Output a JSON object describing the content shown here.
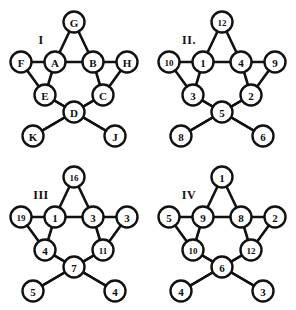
{
  "figure": {
    "background_color": "#ffffff",
    "ink_color": "#111111",
    "panel_count": 4
  },
  "chart_data": {
    "type": "diagram",
    "subtype": "pentagram-node-graph",
    "layout": "2x2 grid of panels",
    "node_positions": {
      "apex": [
        74,
        22
      ],
      "upper_left": [
        21,
        62
      ],
      "upper_right": [
        127,
        62
      ],
      "inner_left": [
        55,
        62
      ],
      "inner_right": [
        93,
        62
      ],
      "mid_left": [
        45,
        95
      ],
      "mid_right": [
        103,
        95
      ],
      "bottom_center": [
        74,
        112
      ],
      "bottom_left": [
        33,
        136
      ],
      "bottom_right": [
        115,
        136
      ]
    },
    "edges": [
      [
        "apex",
        "inner_left"
      ],
      [
        "apex",
        "inner_right"
      ],
      [
        "inner_left",
        "inner_right"
      ],
      [
        "upper_left",
        "inner_left"
      ],
      [
        "inner_right",
        "upper_right"
      ],
      [
        "upper_left",
        "mid_left"
      ],
      [
        "upper_right",
        "mid_right"
      ],
      [
        "inner_left",
        "mid_left"
      ],
      [
        "inner_right",
        "mid_right"
      ],
      [
        "mid_left",
        "bottom_center"
      ],
      [
        "mid_right",
        "bottom_center"
      ],
      [
        "mid_left",
        "bottom_right"
      ],
      [
        "mid_right",
        "bottom_left"
      ],
      [
        "bottom_left",
        "bottom_center"
      ],
      [
        "bottom_right",
        "bottom_center"
      ]
    ],
    "panels": [
      {
        "roman": "I",
        "label_style": "letters",
        "nodes": {
          "apex": "G",
          "upper_left": "F",
          "upper_right": "H",
          "inner_left": "A",
          "inner_right": "B",
          "mid_left": "E",
          "mid_right": "C",
          "bottom_center": "D",
          "bottom_left": "K",
          "bottom_right": "J"
        }
      },
      {
        "roman": "II.",
        "label_style": "numbers",
        "nodes": {
          "apex": "12",
          "upper_left": "10",
          "upper_right": "9",
          "inner_left": "1",
          "inner_right": "4",
          "mid_left": "3",
          "mid_right": "2",
          "bottom_center": "5",
          "bottom_left": "8",
          "bottom_right": "6"
        }
      },
      {
        "roman": "III",
        "label_style": "numbers",
        "nodes": {
          "apex": "16",
          "upper_left": "19",
          "upper_right": "3",
          "inner_left": "1",
          "inner_right": "3",
          "mid_left": "4",
          "mid_right": "11",
          "bottom_center": "7",
          "bottom_left": "5",
          "bottom_right": "4"
        }
      },
      {
        "roman": "IV",
        "label_style": "numbers",
        "nodes": {
          "apex": "1",
          "upper_left": "5",
          "upper_right": "2",
          "inner_left": "9",
          "inner_right": "8",
          "mid_left": "10",
          "mid_right": "12",
          "bottom_center": "6",
          "bottom_left": "4",
          "bottom_right": "3"
        }
      }
    ],
    "roman_label_position": [
      41,
      40
    ]
  }
}
